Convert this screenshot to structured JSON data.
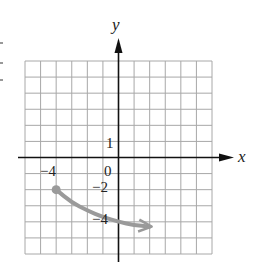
{
  "chart_data": {
    "type": "line",
    "title": "",
    "xlabel": "x",
    "ylabel": "y",
    "xlim": [
      -6,
      6
    ],
    "ylim": [
      -6,
      6
    ],
    "grid": true,
    "grid_step": 1,
    "tick_labels": {
      "x": [
        {
          "value": -4,
          "label": "−4"
        },
        {
          "value": 0,
          "label": "0"
        }
      ],
      "y": [
        {
          "value": 1,
          "label": "1"
        },
        {
          "value": -2,
          "label": "−2"
        },
        {
          "value": -4,
          "label": "−4"
        }
      ]
    },
    "series": [
      {
        "name": "curve",
        "color": "#9a9a9a",
        "start_point": {
          "x": -4,
          "y": -2,
          "marker": "closed-dot"
        },
        "end": "arrow",
        "points": [
          {
            "x": -4,
            "y": -2
          },
          {
            "x": -3,
            "y": -2.8
          },
          {
            "x": -2,
            "y": -3.3
          },
          {
            "x": -1,
            "y": -3.7
          },
          {
            "x": 0,
            "y": -4
          },
          {
            "x": 1,
            "y": -4.2
          },
          {
            "x": 2,
            "y": -4.3
          }
        ]
      }
    ]
  },
  "labels": {
    "x_axis": "x",
    "y_axis": "y",
    "tick_x_neg4": "−4",
    "tick_origin": "0",
    "tick_y_1": "1",
    "tick_y_neg2": "−2",
    "tick_y_neg4": "−4"
  },
  "colors": {
    "grid": "#a8a8a8",
    "axis": "#111111",
    "curve": "#9a9a9a"
  }
}
